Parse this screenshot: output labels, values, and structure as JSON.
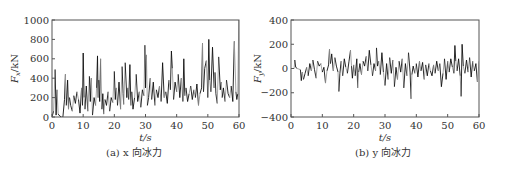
{
  "chart_data": [
    {
      "type": "line",
      "title": "",
      "caption": "(a) x 向冰力",
      "xlabel": "t/s",
      "ylabel": "F_x/kN",
      "xlim": [
        0,
        60
      ],
      "ylim": [
        0,
        1000
      ],
      "xticks": [
        0,
        10,
        20,
        30,
        40,
        50,
        60
      ],
      "yticks": [
        0,
        200,
        400,
        600,
        800,
        1000
      ],
      "grid": false,
      "legend": null,
      "series": [
        {
          "name": "x-direction ice force",
          "colors": [
            "#111111",
            "#9a9a9a"
          ],
          "x": [
            0,
            0.5,
            1,
            1.3,
            1.6,
            2,
            2.5,
            3,
            3.5,
            4,
            4.3,
            4.6,
            5,
            5.3,
            5.6,
            6,
            6.5,
            7,
            7.5,
            8,
            8.5,
            9,
            9.5,
            9.8,
            10,
            10.3,
            10.6,
            11,
            11.5,
            12,
            12.3,
            12.6,
            13,
            13.5,
            14,
            14.3,
            14.6,
            14.8,
            15,
            15.3,
            15.6,
            16,
            16.3,
            16.6,
            17,
            17.5,
            18,
            18.5,
            19,
            19.5,
            20,
            20.3,
            20.6,
            21,
            21.5,
            22,
            22.5,
            22.8,
            23,
            23.5,
            24,
            24.3,
            24.6,
            25,
            25.3,
            25.6,
            26,
            26.5,
            27,
            27.5,
            28,
            28.5,
            29,
            29.5,
            29.8,
            30,
            30.3,
            30.6,
            31,
            31.5,
            32,
            32.5,
            33,
            33.5,
            34,
            34.5,
            35,
            35.5,
            36,
            36.5,
            37,
            37.5,
            38,
            38.3,
            38.6,
            39,
            39.5,
            40,
            40.5,
            41,
            41.5,
            42,
            42.3,
            42.6,
            43,
            43.5,
            44,
            44.5,
            45,
            45.5,
            46,
            46.5,
            47,
            47.5,
            48,
            48.3,
            48.6,
            49,
            49.5,
            50,
            50.3,
            50.6,
            51,
            51.5,
            52,
            52.3,
            52.6,
            53,
            53.5,
            54,
            54.3,
            54.6,
            55,
            55.5,
            56,
            56.5,
            57,
            57.5,
            58,
            58.5,
            59,
            59.3,
            59.6,
            60
          ],
          "values": [
            0,
            60,
            490,
            20,
            280,
            30,
            10,
            0,
            0,
            180,
            440,
            120,
            380,
            80,
            200,
            120,
            60,
            220,
            140,
            260,
            180,
            40,
            300,
            120,
            660,
            200,
            80,
            320,
            60,
            420,
            160,
            400,
            20,
            200,
            120,
            300,
            630,
            200,
            380,
            160,
            600,
            80,
            240,
            30,
            180,
            120,
            260,
            60,
            200,
            150,
            470,
            180,
            300,
            120,
            360,
            80,
            520,
            240,
            130,
            560,
            200,
            300,
            180,
            540,
            120,
            260,
            80,
            200,
            440,
            160,
            260,
            100,
            280,
            220,
            740,
            300,
            640,
            120,
            200,
            400,
            180,
            360,
            120,
            280,
            200,
            320,
            160,
            560,
            200,
            260,
            140,
            380,
            280,
            680,
            500,
            180,
            360,
            260,
            440,
            200,
            400,
            160,
            600,
            220,
            300,
            160,
            240,
            320,
            180,
            280,
            200,
            340,
            120,
            240,
            300,
            760,
            260,
            500,
            580,
            200,
            800,
            380,
            260,
            720,
            300,
            460,
            240,
            140,
            620,
            280,
            360,
            200,
            300,
            160,
            380,
            240,
            200,
            320,
            160,
            780,
            260,
            180,
            240
          ]
        }
      ]
    },
    {
      "type": "line",
      "title": "",
      "caption": "(b) y 向冰力",
      "xlabel": "t/s",
      "ylabel": "F_y/kN",
      "xlim": [
        0,
        60
      ],
      "ylim": [
        -400,
        400
      ],
      "xticks": [
        0,
        10,
        20,
        30,
        40,
        50,
        60
      ],
      "yticks": [
        -400,
        -200,
        0,
        200,
        400
      ],
      "grid": false,
      "legend": null,
      "series": [
        {
          "name": "y-direction ice force",
          "colors": [
            "#111111",
            "#9a9a9a"
          ],
          "x": [
            0,
            1,
            1.2,
            1.5,
            2,
            3,
            3.3,
            3.6,
            4,
            4.5,
            5,
            5.5,
            6,
            6.5,
            7,
            7.5,
            8,
            8.5,
            9,
            9.5,
            10,
            10.5,
            11,
            11.5,
            12,
            12.3,
            12.6,
            13,
            13.5,
            14,
            14.5,
            15,
            15.3,
            15.6,
            16,
            16.5,
            17,
            17.5,
            18,
            18.5,
            19,
            19.3,
            19.6,
            20,
            20.5,
            21,
            21.3,
            21.6,
            22,
            22.5,
            23,
            23.5,
            24,
            24.5,
            25,
            25.5,
            26,
            26.5,
            27,
            27.3,
            27.6,
            28,
            28.5,
            29,
            29.5,
            30,
            30.5,
            31,
            31.5,
            32,
            32.5,
            33,
            33.5,
            34,
            34.5,
            35,
            35.5,
            36,
            36.5,
            37,
            37.5,
            38,
            38.3,
            38.6,
            39,
            39.5,
            40,
            40.5,
            41,
            41.5,
            42,
            42.5,
            43,
            43.5,
            44,
            44.5,
            45,
            45.5,
            46,
            46.5,
            47,
            47.5,
            48,
            48.5,
            49,
            49.5,
            50,
            50.5,
            51,
            51.5,
            52,
            52.3,
            52.6,
            53,
            53.5,
            54,
            54.3,
            54.6,
            55,
            55.5,
            56,
            56.5,
            57,
            57.5,
            58,
            58.5,
            59,
            59.5,
            60
          ],
          "values": [
            0,
            0,
            70,
            10,
            0,
            -10,
            -100,
            -30,
            -90,
            -40,
            10,
            -60,
            40,
            -20,
            70,
            -10,
            -80,
            60,
            20,
            40,
            -30,
            10,
            -120,
            -20,
            30,
            160,
            40,
            120,
            -20,
            90,
            20,
            -30,
            -190,
            -40,
            60,
            -60,
            80,
            10,
            -40,
            60,
            150,
            20,
            -80,
            30,
            -60,
            80,
            -160,
            -30,
            40,
            -50,
            60,
            20,
            100,
            -20,
            150,
            30,
            -60,
            40,
            -20,
            170,
            20,
            60,
            -50,
            130,
            -30,
            -140,
            40,
            -90,
            90,
            -40,
            70,
            -150,
            10,
            -90,
            60,
            -30,
            80,
            -160,
            40,
            -60,
            130,
            -30,
            -250,
            -50,
            20,
            -40,
            40,
            -70,
            60,
            -20,
            50,
            -90,
            30,
            -60,
            40,
            -20,
            -60,
            30,
            -40,
            60,
            -20,
            40,
            -150,
            -40,
            80,
            -90,
            60,
            -30,
            80,
            10,
            -40,
            190,
            60,
            -20,
            80,
            -60,
            -230,
            200,
            20,
            -40,
            70,
            -30,
            90,
            -70,
            60,
            -20,
            40,
            -110,
            60,
            -30,
            20
          ]
        }
      ]
    }
  ]
}
